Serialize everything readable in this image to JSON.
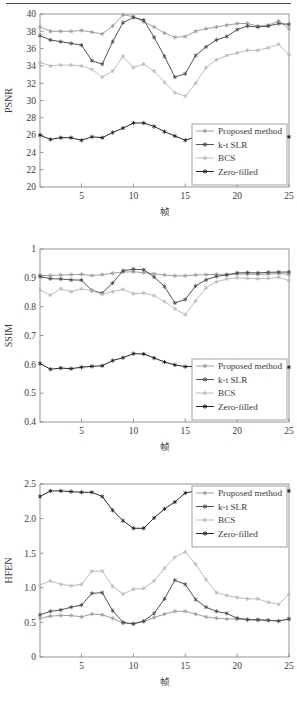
{
  "figure": {
    "x_axis_label": "帧",
    "x_ticks": [
      5,
      10,
      15,
      20,
      25
    ],
    "x_range": [
      1,
      25
    ]
  },
  "legend": {
    "items": [
      {
        "label": "Proposed method",
        "color": "#9a9a9a",
        "marker": "star"
      },
      {
        "label": "k-t SLR",
        "color": "#4a4a4a",
        "marker": "star"
      },
      {
        "label": "BCS",
        "color": "#b9b9b9",
        "marker": "star"
      },
      {
        "label": "Zero-filled",
        "color": "#1d1d1d",
        "marker": "star"
      }
    ]
  },
  "colors": {
    "proposed": "#9a9a9a",
    "ktslr": "#4a4a4a",
    "bcs": "#b9b9b9",
    "zerofilled": "#1d1d1d",
    "axis": "#8a8a8a",
    "text": "#3a3a3a",
    "rule": "#4a4a4a"
  },
  "chart_data": [
    {
      "type": "line",
      "title": "",
      "xlabel": "帧",
      "ylabel": "PSNR",
      "xlim": [
        1,
        25
      ],
      "ylim": [
        20,
        40
      ],
      "yticks": [
        20,
        22,
        24,
        26,
        28,
        30,
        32,
        34,
        36,
        38,
        40
      ],
      "xticks": [
        5,
        10,
        15,
        20,
        25
      ],
      "grid": false,
      "legend_position": "bottom-right",
      "x": [
        1,
        2,
        3,
        4,
        5,
        6,
        7,
        8,
        9,
        10,
        11,
        12,
        13,
        14,
        15,
        16,
        17,
        18,
        19,
        20,
        21,
        22,
        23,
        24,
        25
      ],
      "series": [
        {
          "name": "Proposed method",
          "color": "#9a9a9a",
          "values": [
            38.5,
            38.0,
            38.0,
            38.0,
            38.1,
            37.9,
            37.7,
            38.6,
            39.9,
            39.7,
            39.1,
            38.5,
            37.8,
            37.3,
            37.4,
            38.0,
            38.3,
            38.5,
            38.7,
            38.9,
            38.9,
            38.6,
            38.7,
            39.2,
            38.3
          ]
        },
        {
          "name": "k-t SLR",
          "color": "#4a4a4a",
          "values": [
            37.5,
            37.0,
            36.8,
            36.6,
            36.4,
            34.6,
            34.2,
            36.8,
            39.0,
            39.6,
            39.3,
            37.3,
            35.1,
            32.7,
            33.1,
            35.2,
            36.2,
            37.0,
            37.4,
            38.2,
            38.6,
            38.5,
            38.6,
            38.9,
            38.8
          ]
        },
        {
          "name": "BCS",
          "color": "#b9b9b9",
          "values": [
            34.4,
            34.0,
            34.1,
            34.1,
            34.0,
            33.6,
            32.7,
            33.4,
            35.1,
            33.8,
            34.2,
            33.4,
            32.1,
            30.9,
            30.5,
            32.0,
            33.8,
            34.7,
            35.2,
            35.5,
            35.8,
            35.8,
            36.1,
            36.5,
            35.3
          ]
        },
        {
          "name": "Zero-filled",
          "color": "#1d1d1d",
          "values": [
            26.0,
            25.5,
            25.7,
            25.7,
            25.4,
            25.8,
            25.7,
            26.3,
            26.8,
            27.4,
            27.4,
            27.0,
            26.4,
            25.9,
            25.4,
            25.8,
            25.8,
            25.6,
            25.5,
            25.8,
            25.8,
            25.7,
            25.5,
            25.8,
            25.8
          ]
        }
      ]
    },
    {
      "type": "line",
      "title": "",
      "xlabel": "帧",
      "ylabel": "SSIM",
      "xlim": [
        1,
        25
      ],
      "ylim": [
        0.4,
        1.0
      ],
      "yticks": [
        0.4,
        0.5,
        0.6,
        0.7,
        0.8,
        0.9,
        1
      ],
      "ytick_labels": [
        "0.4",
        "0.5",
        "0.6",
        "0.7",
        "0.8",
        "0.9",
        "1"
      ],
      "xticks": [
        5,
        10,
        15,
        20,
        25
      ],
      "grid": false,
      "legend_position": "bottom-right",
      "x": [
        1,
        2,
        3,
        4,
        5,
        6,
        7,
        8,
        9,
        10,
        11,
        12,
        13,
        14,
        15,
        16,
        17,
        18,
        19,
        20,
        21,
        22,
        23,
        24,
        25
      ],
      "series": [
        {
          "name": "Proposed method",
          "color": "#9a9a9a",
          "values": [
            0.908,
            0.908,
            0.91,
            0.911,
            0.912,
            0.908,
            0.911,
            0.916,
            0.92,
            0.921,
            0.918,
            0.914,
            0.91,
            0.907,
            0.907,
            0.91,
            0.911,
            0.912,
            0.912,
            0.913,
            0.913,
            0.912,
            0.913,
            0.915,
            0.912
          ]
        },
        {
          "name": "k-t SLR",
          "color": "#4a4a4a",
          "values": [
            0.905,
            0.897,
            0.896,
            0.893,
            0.892,
            0.856,
            0.847,
            0.882,
            0.925,
            0.93,
            0.928,
            0.903,
            0.87,
            0.813,
            0.825,
            0.872,
            0.893,
            0.905,
            0.91,
            0.917,
            0.918,
            0.917,
            0.919,
            0.92,
            0.92
          ]
        },
        {
          "name": "BCS",
          "color": "#b9b9b9",
          "values": [
            0.858,
            0.84,
            0.862,
            0.852,
            0.862,
            0.855,
            0.843,
            0.852,
            0.86,
            0.845,
            0.847,
            0.838,
            0.818,
            0.793,
            0.772,
            0.82,
            0.866,
            0.886,
            0.896,
            0.9,
            0.898,
            0.897,
            0.898,
            0.902,
            0.89
          ]
        },
        {
          "name": "Zero-filled",
          "color": "#1d1d1d",
          "values": [
            0.603,
            0.583,
            0.587,
            0.585,
            0.59,
            0.593,
            0.595,
            0.613,
            0.623,
            0.637,
            0.636,
            0.622,
            0.608,
            0.598,
            0.592,
            0.593,
            0.592,
            0.587,
            0.587,
            0.589,
            0.59,
            0.591,
            0.589,
            0.593,
            0.59
          ]
        }
      ]
    },
    {
      "type": "line",
      "title": "",
      "xlabel": "帧",
      "ylabel": "HFEN",
      "xlim": [
        1,
        25
      ],
      "ylim": [
        0,
        2.5
      ],
      "yticks": [
        0,
        0.5,
        1.0,
        1.5,
        2.0,
        2.5
      ],
      "ytick_labels": [
        "0",
        "0.5",
        "1.0",
        "1.5",
        "2.0",
        "2.5"
      ],
      "xticks": [
        5,
        10,
        15,
        20,
        25
      ],
      "grid": false,
      "legend_position": "top-right",
      "x": [
        1,
        2,
        3,
        4,
        5,
        6,
        7,
        8,
        9,
        10,
        11,
        12,
        13,
        14,
        15,
        16,
        17,
        18,
        19,
        20,
        21,
        22,
        23,
        24,
        25
      ],
      "series": [
        {
          "name": "Proposed method",
          "color": "#9a9a9a",
          "values": [
            0.56,
            0.59,
            0.6,
            0.6,
            0.58,
            0.62,
            0.61,
            0.56,
            0.49,
            0.48,
            0.51,
            0.57,
            0.62,
            0.66,
            0.66,
            0.62,
            0.58,
            0.56,
            0.55,
            0.55,
            0.54,
            0.53,
            0.53,
            0.52,
            0.55
          ]
        },
        {
          "name": "k-t SLR",
          "color": "#4a4a4a",
          "values": [
            0.61,
            0.66,
            0.68,
            0.72,
            0.75,
            0.92,
            0.93,
            0.67,
            0.5,
            0.48,
            0.52,
            0.63,
            0.84,
            1.11,
            1.05,
            0.83,
            0.72,
            0.66,
            0.63,
            0.56,
            0.54,
            0.54,
            0.53,
            0.52,
            0.55
          ]
        },
        {
          "name": "BCS",
          "color": "#b9b9b9",
          "values": [
            1.04,
            1.1,
            1.05,
            1.03,
            1.05,
            1.24,
            1.24,
            1.02,
            0.91,
            0.98,
            0.99,
            1.1,
            1.28,
            1.44,
            1.52,
            1.34,
            1.12,
            0.93,
            0.89,
            0.86,
            0.84,
            0.84,
            0.79,
            0.76,
            0.91
          ]
        },
        {
          "name": "Zero-filled",
          "color": "#1d1d1d",
          "values": [
            2.32,
            2.4,
            2.4,
            2.39,
            2.38,
            2.38,
            2.32,
            2.12,
            1.97,
            1.86,
            1.86,
            2.01,
            2.14,
            2.24,
            2.37,
            2.4,
            2.4,
            2.4,
            2.4,
            2.4,
            2.4,
            2.4,
            2.4,
            2.4,
            2.4
          ]
        }
      ]
    }
  ]
}
